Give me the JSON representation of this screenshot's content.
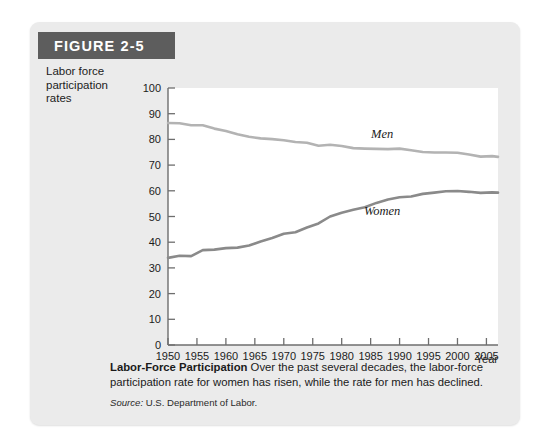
{
  "figure": {
    "number_label": "FIGURE 2-5",
    "axis_title_lines": [
      "Labor force",
      "participation",
      "rates"
    ],
    "caption_bold": "Labor-Force Participation",
    "caption_text": " Over the past several decades, the labor-force participation rate for women has risen, while the rate for men has declined.",
    "source_prefix": "Source:",
    "source_text": " U.S. Department of Labor.",
    "colors": {
      "panel_background": "#ebebeb",
      "tab_background": "#5d5d5d",
      "tab_text": "#ffffff",
      "plot_background": "#ffffff",
      "axis": "#6e6e6e",
      "men_line": "#b3b3b3",
      "women_line": "#8a8a8a",
      "text": "#1c1c1c"
    }
  },
  "chart_data": {
    "type": "line",
    "title": "Labor-Force Participation",
    "xlabel": "Year",
    "ylabel": "Labor force participation rates",
    "xlim": [
      1950,
      2007
    ],
    "ylim": [
      0,
      100
    ],
    "grid": false,
    "legend_position": "inline-annotation",
    "xticks": [
      1950,
      1955,
      1960,
      1965,
      1970,
      1975,
      1980,
      1985,
      1990,
      1995,
      2000,
      2005
    ],
    "yticks": [
      0,
      10,
      20,
      30,
      40,
      50,
      60,
      70,
      80,
      90,
      100
    ],
    "x": [
      1950,
      1952,
      1954,
      1956,
      1958,
      1960,
      1962,
      1964,
      1966,
      1968,
      1970,
      1972,
      1974,
      1976,
      1978,
      1980,
      1982,
      1984,
      1986,
      1988,
      1990,
      1992,
      1994,
      1996,
      1998,
      2000,
      2002,
      2004,
      2006,
      2007
    ],
    "series": [
      {
        "name": "Men",
        "color": "#b3b3b3",
        "values": [
          86.4,
          86.3,
          85.5,
          85.5,
          84.2,
          83.3,
          82.0,
          81.0,
          80.4,
          80.1,
          79.7,
          79.0,
          78.7,
          77.5,
          77.9,
          77.4,
          76.6,
          76.4,
          76.3,
          76.2,
          76.4,
          75.8,
          75.1,
          74.9,
          74.9,
          74.8,
          74.1,
          73.3,
          73.5,
          73.2
        ]
      },
      {
        "name": "Women",
        "color": "#8a8a8a",
        "values": [
          33.9,
          34.7,
          34.6,
          36.9,
          37.1,
          37.7,
          37.9,
          38.7,
          40.3,
          41.6,
          43.3,
          43.9,
          45.7,
          47.3,
          50.0,
          51.5,
          52.6,
          53.6,
          55.3,
          56.6,
          57.5,
          57.8,
          58.8,
          59.3,
          59.8,
          59.9,
          59.6,
          59.2,
          59.4,
          59.3
        ]
      }
    ],
    "annotations": [
      {
        "text": "Men",
        "x": 1987,
        "y": 80.5
      },
      {
        "text": "Women",
        "x": 1987,
        "y": 50.5
      }
    ]
  }
}
